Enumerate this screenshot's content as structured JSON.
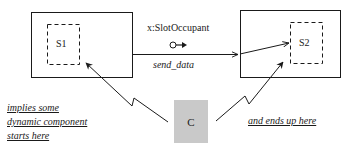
{
  "diagram": {
    "slots": [
      {
        "id": "S1",
        "label": "S1"
      },
      {
        "id": "S2",
        "label": "S2"
      }
    ],
    "connector": {
      "label": "x:SlotOccupant",
      "icon": "circle-arrow-icon",
      "message": "send_data"
    },
    "component": {
      "label": "C",
      "fill": "#c9c9c9"
    },
    "annotations": {
      "start": [
        "implies some",
        "dynamic component",
        "starts here"
      ],
      "end": "and ends up here"
    }
  }
}
